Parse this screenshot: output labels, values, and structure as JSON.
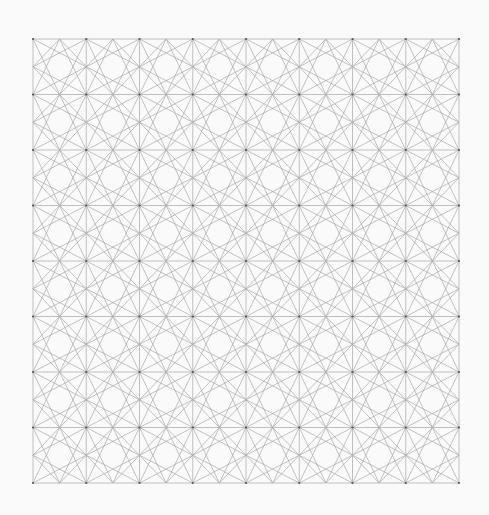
{
  "diagram": {
    "type": "geometric-tiling",
    "background_color": "#fafafa",
    "line_color": "#a8a8a8",
    "grid_line_color": "#b0b0b0",
    "vertex_color": "#555555",
    "bounds": {
      "x0": 33,
      "y0": 39,
      "x1": 459,
      "y1": 483
    },
    "columns": 8,
    "rows": 8,
    "cell_lines": [
      [
        "TL",
        "BM"
      ],
      [
        "TL",
        "RM"
      ],
      [
        "TR",
        "BM"
      ],
      [
        "TR",
        "LM"
      ],
      [
        "BL",
        "TM"
      ],
      [
        "BL",
        "RM"
      ],
      [
        "BR",
        "TM"
      ],
      [
        "BR",
        "LM"
      ],
      [
        "TM",
        "RM"
      ],
      [
        "RM",
        "BM"
      ],
      [
        "BM",
        "LM"
      ],
      [
        "LM",
        "TM"
      ]
    ]
  }
}
